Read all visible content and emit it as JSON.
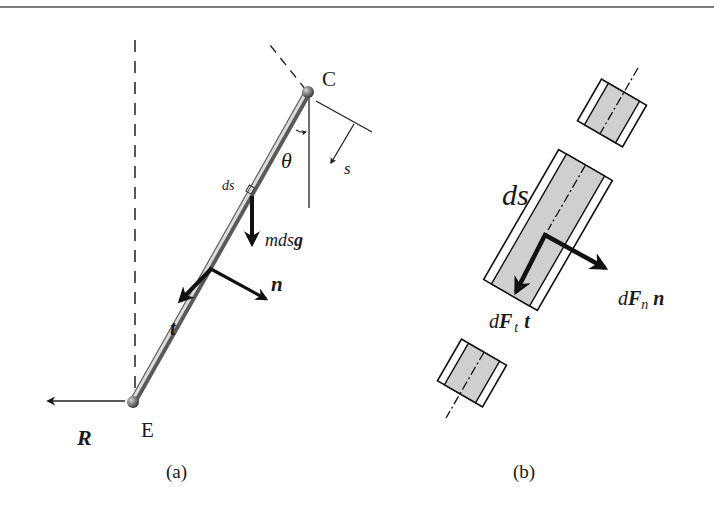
{
  "figure": {
    "panels": [
      {
        "id": "a",
        "caption": "(a)",
        "labels": {
          "point_top": "C",
          "point_bottom": "E",
          "angle": "θ",
          "arc_coord": "s",
          "element": "ds",
          "weight": "mdsg",
          "weight_parts": {
            "scalar": "mds",
            "vector": "g"
          },
          "normal": "n",
          "tangent": "t",
          "reaction": "R"
        }
      },
      {
        "id": "b",
        "caption": "(b)",
        "labels": {
          "element": "ds",
          "tangent_force": {
            "d": "d",
            "F": "F",
            "sub": "t",
            "vec": "t"
          },
          "normal_force": {
            "d": "d",
            "F": "F",
            "sub": "n",
            "vec": "n"
          }
        }
      }
    ],
    "colors": {
      "line": "#1a1a1a",
      "rod": "#8a8a8a",
      "rod_highlight": "#d8d8d8",
      "element_fill": "#cfcfcf",
      "border": "#7a7a7a"
    }
  }
}
